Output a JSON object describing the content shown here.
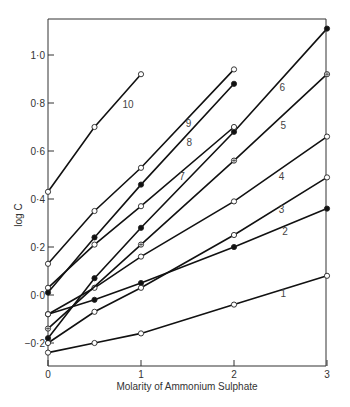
{
  "chart_data": {
    "type": "line",
    "title": "",
    "xlabel": "Molarity of  Ammonium Sulphate",
    "ylabel": "log C",
    "xlim": [
      0,
      3
    ],
    "ylim": [
      -0.3,
      1.15
    ],
    "xticks": [
      0,
      1,
      2,
      3
    ],
    "xtick_labels": [
      "0",
      "1",
      "2",
      "3"
    ],
    "yticks": [
      -0.2,
      0.0,
      0.2,
      0.4,
      0.6,
      0.8,
      1.0
    ],
    "ytick_labels": [
      "−0·2",
      "0·0",
      "0·2",
      "0·4",
      "0·6",
      "0·8",
      "1·0"
    ],
    "grid": false,
    "legend": "inline numeric labels on lines",
    "series": [
      {
        "name": "1",
        "marker": "open-circle",
        "x": [
          0,
          0.5,
          1,
          2,
          3
        ],
        "y": [
          -0.24,
          -0.2,
          -0.16,
          -0.04,
          0.08
        ],
        "label_pos": [
          2.5,
          -0.01
        ]
      },
      {
        "name": "2",
        "marker": "filled-circle",
        "x": [
          0,
          0.5,
          1,
          2,
          3
        ],
        "y": [
          -0.08,
          -0.02,
          0.05,
          0.2,
          0.36
        ],
        "label_pos": [
          2.52,
          0.25
        ]
      },
      {
        "name": "3",
        "marker": "open-circle",
        "x": [
          0,
          0.5,
          1,
          2,
          3
        ],
        "y": [
          -0.2,
          -0.07,
          0.03,
          0.25,
          0.49
        ],
        "label_pos": [
          2.48,
          0.34
        ]
      },
      {
        "name": "4",
        "marker": "open-circle",
        "x": [
          0,
          0.5,
          1,
          2,
          3
        ],
        "y": [
          -0.08,
          0.03,
          0.16,
          0.39,
          0.66
        ],
        "label_pos": [
          2.48,
          0.48
        ]
      },
      {
        "name": "5",
        "marker": "circle-cross",
        "x": [
          0,
          1,
          2,
          3
        ],
        "y": [
          -0.14,
          0.21,
          0.56,
          0.92
        ],
        "label_pos": [
          2.5,
          0.69
        ]
      },
      {
        "name": "6",
        "marker": "filled-circle",
        "x": [
          0,
          0.5,
          1,
          2,
          3
        ],
        "y": [
          -0.18,
          0.07,
          0.28,
          0.68,
          1.11
        ],
        "label_pos": [
          2.49,
          0.85
        ]
      },
      {
        "name": "7",
        "marker": "open-circle",
        "x": [
          0,
          0.5,
          1,
          2
        ],
        "y": [
          0.03,
          0.21,
          0.37,
          0.7
        ],
        "label_pos": [
          1.41,
          0.48
        ]
      },
      {
        "name": "8",
        "marker": "filled-circle",
        "x": [
          0,
          0.5,
          1,
          2
        ],
        "y": [
          0.01,
          0.24,
          0.46,
          0.88
        ],
        "label_pos": [
          1.49,
          0.62
        ]
      },
      {
        "name": "9",
        "marker": "open-circle",
        "x": [
          0,
          0.5,
          1,
          2
        ],
        "y": [
          0.13,
          0.35,
          0.53,
          0.94
        ],
        "label_pos": [
          1.48,
          0.7
        ]
      },
      {
        "name": "10",
        "marker": "open-circle",
        "x": [
          0,
          0.5,
          1
        ],
        "y": [
          0.43,
          0.7,
          0.92
        ],
        "label_pos": [
          0.8,
          0.78
        ]
      }
    ]
  }
}
